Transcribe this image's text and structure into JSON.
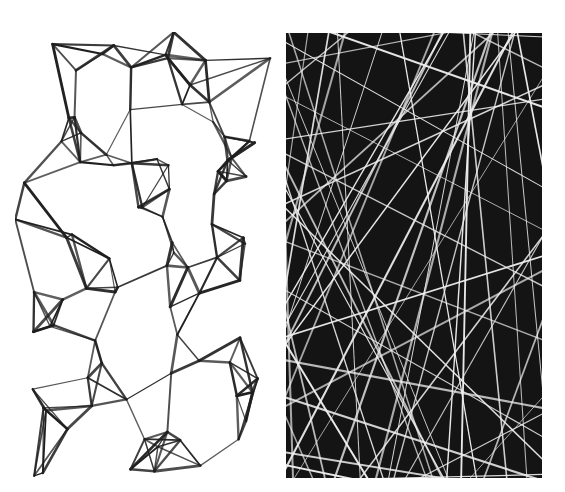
{
  "figure": {
    "panels": [
      {
        "id": "left",
        "description": "Voronoi-like polygonal network of dark lines on white background",
        "background": "#ffffff",
        "stroke": "#1e1e1e",
        "width": 257,
        "height": 445,
        "seed": 7,
        "points": 90
      },
      {
        "id": "right",
        "description": "Random straight line network of white lines on black background",
        "background": "#141414",
        "stroke": "#f0f0f0",
        "width": 256,
        "height": 445,
        "seed": 11,
        "lines": 70
      }
    ]
  }
}
